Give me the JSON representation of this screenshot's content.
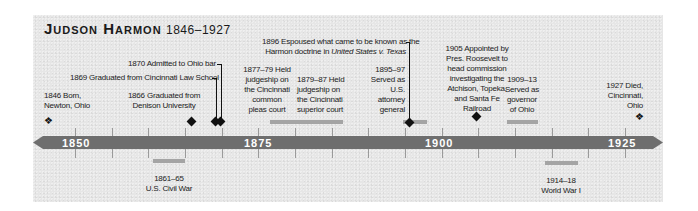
{
  "title": {
    "name": "Judson Harmon",
    "years": "1846–1927"
  },
  "axis": {
    "labels": [
      "1850",
      "1875",
      "1900",
      "1925"
    ],
    "color": "#6e6e6e"
  },
  "events": {
    "born": {
      "line1": "1846 Born,",
      "line2": "Newton, Ohio"
    },
    "denison": {
      "line1": "1866 Graduated from",
      "line2": "Denison University"
    },
    "law_school": {
      "text": "1869 Graduated from Cincinnati Law School"
    },
    "ohio_bar": {
      "text": "1870 Admitted to Ohio bar"
    },
    "common_pleas": {
      "lines": [
        "1877–79 Held",
        "judgeship on",
        "the Cincinnati",
        "common",
        "pleas court"
      ]
    },
    "superior": {
      "lines": [
        "1879–87 Held",
        "judgeship on",
        "the Cincinnati",
        "superior court"
      ]
    },
    "harmon_doctrine": {
      "line1": "1896 Espoused what came to be known as the",
      "line2_prefix": "Harmon doctrine in ",
      "line2_italic": "United States v. Texas"
    },
    "attorney_general": {
      "lines": [
        "1895–97",
        "Served as",
        "U.S.",
        "attorney",
        "general"
      ]
    },
    "commission": {
      "lines": [
        "1905 Appointed by",
        "Pres. Roosevelt to",
        "head commission",
        "investigating the",
        "Atchison, Topeka,",
        "and Santa Fe",
        "Railroad"
      ]
    },
    "governor": {
      "lines": [
        "1909–13",
        "Served as",
        "governor",
        "of Ohio"
      ]
    },
    "died": {
      "lines": [
        "1927 Died,",
        "Cincinnati,",
        "Ohio"
      ]
    },
    "civil_war": {
      "line1": "1861–65",
      "line2": "U.S. Civil War"
    },
    "wwi": {
      "line1": "1914–18",
      "line2": "World War I"
    }
  },
  "icons": {
    "birth_death_marker": "◆-with-dot",
    "event_marker": "diamond"
  }
}
